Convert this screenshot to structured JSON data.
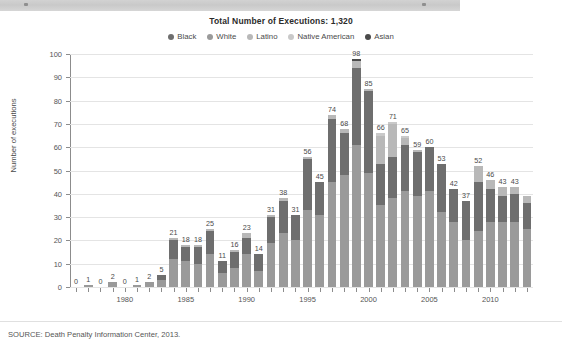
{
  "window": {
    "toolbar_present": true
  },
  "figure": {
    "source_note": "SOURCE: Death Penalty Information Center, 2013."
  },
  "chart_data": {
    "type": "bar",
    "stacked": true,
    "title": "Total Number of Executions: 1,320",
    "xlabel": "",
    "ylabel": "Number of executions",
    "ylim": [
      0,
      100
    ],
    "ytick_values": [
      0,
      10,
      20,
      30,
      40,
      50,
      60,
      70,
      80,
      90,
      100
    ],
    "ytick_labels": [
      "0",
      "10",
      "20",
      "30",
      "40",
      "50",
      "60",
      "70",
      "80",
      "90",
      "100"
    ],
    "grid": "horizontal",
    "legend_position": "top-center",
    "legend": [
      "Black",
      "White",
      "Latino",
      "Native American",
      "Asian"
    ],
    "series_colors": [
      "#6e6e6e",
      "#9a9a9a",
      "#b8b8b8",
      "#c9c9c9",
      "#4a4a4a"
    ],
    "categories": [
      1976,
      1977,
      1978,
      1979,
      1980,
      1981,
      1982,
      1983,
      1984,
      1985,
      1986,
      1987,
      1988,
      1989,
      1990,
      1991,
      1992,
      1993,
      1994,
      1995,
      1996,
      1997,
      1998,
      1999,
      2000,
      2001,
      2002,
      2003,
      2004,
      2005,
      2006,
      2007,
      2008,
      2009,
      2010,
      2011,
      2012,
      2013
    ],
    "xtick_labels": [
      "1980",
      "1985",
      "1990",
      "1995",
      "2000",
      "2005",
      "2010"
    ],
    "xtick_label_years": [
      1980,
      1985,
      1990,
      1995,
      2000,
      2005,
      2010
    ],
    "totals": [
      0,
      1,
      0,
      2,
      0,
      1,
      2,
      5,
      21,
      18,
      18,
      25,
      11,
      16,
      23,
      14,
      31,
      38,
      31,
      56,
      45,
      74,
      68,
      98,
      85,
      66,
      71,
      65,
      59,
      60,
      53,
      42,
      37,
      52,
      46,
      43,
      43,
      39
    ],
    "visible_value_labels": [
      "0",
      "1",
      "0",
      "2",
      "0",
      "1",
      "2",
      "5",
      "21",
      "18",
      "18",
      "25",
      "11",
      "16",
      "23",
      "14",
      "31",
      "38",
      "31",
      "56",
      "45",
      "74",
      "68",
      "98",
      "85",
      "66",
      "71",
      "65",
      "59",
      "60",
      "53",
      "42",
      "37",
      "52",
      "46",
      "43",
      "43",
      ""
    ],
    "series": [
      {
        "name": "White",
        "color": "#9a9a9a",
        "values": [
          0,
          1,
          0,
          2,
          0,
          1,
          2,
          3,
          12,
          11,
          10,
          14,
          6,
          8,
          14,
          7,
          19,
          23,
          20,
          33,
          31,
          45,
          48,
          61,
          49,
          35,
          38,
          41,
          39,
          41,
          32,
          28,
          20,
          24,
          28,
          28,
          28,
          25
        ]
      },
      {
        "name": "Black",
        "color": "#6e6e6e",
        "values": [
          0,
          0,
          0,
          0,
          0,
          0,
          0,
          2,
          8,
          6,
          7,
          10,
          5,
          7,
          7,
          7,
          11,
          14,
          11,
          22,
          14,
          27,
          18,
          33,
          35,
          18,
          18,
          20,
          19,
          19,
          21,
          14,
          17,
          21,
          14,
          11,
          12,
          11
        ]
      },
      {
        "name": "Latino",
        "color": "#b8b8b8",
        "values": [
          0,
          0,
          0,
          0,
          0,
          0,
          0,
          0,
          1,
          1,
          1,
          1,
          0,
          1,
          2,
          0,
          1,
          1,
          0,
          1,
          0,
          2,
          2,
          3,
          1,
          12,
          14,
          3,
          1,
          0,
          0,
          0,
          0,
          7,
          4,
          4,
          3,
          3
        ]
      },
      {
        "name": "Native American",
        "color": "#c9c9c9",
        "values": [
          0,
          0,
          0,
          0,
          0,
          0,
          0,
          0,
          0,
          0,
          0,
          0,
          0,
          0,
          0,
          0,
          0,
          0,
          0,
          0,
          0,
          0,
          0,
          0,
          0,
          1,
          1,
          1,
          0,
          0,
          0,
          0,
          0,
          0,
          0,
          0,
          0,
          0
        ]
      },
      {
        "name": "Asian",
        "color": "#4a4a4a",
        "values": [
          0,
          0,
          0,
          0,
          0,
          0,
          0,
          0,
          0,
          0,
          0,
          0,
          0,
          0,
          0,
          0,
          0,
          0,
          0,
          0,
          0,
          0,
          0,
          1,
          0,
          0,
          0,
          0,
          0,
          0,
          0,
          0,
          0,
          0,
          0,
          0,
          0,
          0
        ]
      }
    ]
  }
}
